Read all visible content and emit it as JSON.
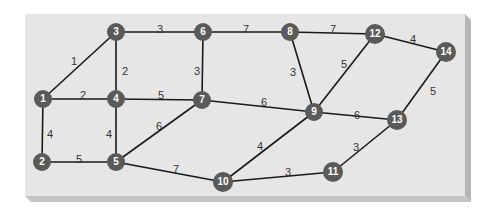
{
  "colors": {
    "panel_face": "#e6e6e6",
    "panel_edge_right": "#b5b5b5",
    "panel_edge_bottom": "#c4c4c4",
    "node_fill": "#5a5a5a",
    "node_text": "#ffffff",
    "edge_color": "#1a1a1a",
    "label_color": "#333333"
  },
  "nodes": [
    {
      "id": "1",
      "x": 43,
      "y": 99
    },
    {
      "id": "2",
      "x": 42,
      "y": 162
    },
    {
      "id": "3",
      "x": 116,
      "y": 32
    },
    {
      "id": "4",
      "x": 116,
      "y": 99
    },
    {
      "id": "5",
      "x": 116,
      "y": 162
    },
    {
      "id": "6",
      "x": 203,
      "y": 32
    },
    {
      "id": "7",
      "x": 202,
      "y": 100
    },
    {
      "id": "8",
      "x": 290,
      "y": 32
    },
    {
      "id": "9",
      "x": 314,
      "y": 112
    },
    {
      "id": "10",
      "x": 223,
      "y": 182
    },
    {
      "id": "11",
      "x": 333,
      "y": 172
    },
    {
      "id": "12",
      "x": 375,
      "y": 34
    },
    {
      "id": "13",
      "x": 397,
      "y": 120
    },
    {
      "id": "14",
      "x": 446,
      "y": 52
    }
  ],
  "edges": [
    {
      "from": "1",
      "to": "3",
      "weight": "1",
      "lx": 74,
      "ly": 62
    },
    {
      "from": "1",
      "to": "4",
      "weight": "2",
      "lx": 83,
      "ly": 96
    },
    {
      "from": "1",
      "to": "2",
      "weight": "4",
      "lx": 50,
      "ly": 135
    },
    {
      "from": "3",
      "to": "4",
      "weight": "2",
      "lx": 125,
      "ly": 72
    },
    {
      "from": "3",
      "to": "6",
      "weight": "3",
      "lx": 160,
      "ly": 30
    },
    {
      "from": "4",
      "to": "7",
      "weight": "5",
      "lx": 161,
      "ly": 96
    },
    {
      "from": "4",
      "to": "5",
      "weight": "4",
      "lx": 109,
      "ly": 135
    },
    {
      "from": "2",
      "to": "5",
      "weight": "5",
      "lx": 79,
      "ly": 160
    },
    {
      "from": "5",
      "to": "7",
      "weight": "6",
      "lx": 159,
      "ly": 127
    },
    {
      "from": "5",
      "to": "10",
      "weight": "7",
      "lx": 176,
      "ly": 170
    },
    {
      "from": "6",
      "to": "7",
      "weight": "3",
      "lx": 197,
      "ly": 72
    },
    {
      "from": "6",
      "to": "8",
      "weight": "7",
      "lx": 246,
      "ly": 30
    },
    {
      "from": "7",
      "to": "9",
      "weight": "6",
      "lx": 264,
      "ly": 103
    },
    {
      "from": "8",
      "to": "12",
      "weight": "7",
      "lx": 333,
      "ly": 30
    },
    {
      "from": "8",
      "to": "9",
      "weight": "3",
      "lx": 293,
      "ly": 73
    },
    {
      "from": "9",
      "to": "12",
      "weight": "5",
      "lx": 344,
      "ly": 65
    },
    {
      "from": "9",
      "to": "13",
      "weight": "6",
      "lx": 357,
      "ly": 116
    },
    {
      "from": "9",
      "to": "10",
      "weight": "4",
      "lx": 260,
      "ly": 147
    },
    {
      "from": "10",
      "to": "11",
      "weight": "3",
      "lx": 288,
      "ly": 173
    },
    {
      "from": "11",
      "to": "13",
      "weight": "3",
      "lx": 356,
      "ly": 148
    },
    {
      "from": "12",
      "to": "14",
      "weight": "4",
      "lx": 413,
      "ly": 40
    },
    {
      "from": "14",
      "to": "13",
      "weight": "5",
      "lx": 433,
      "ly": 92
    }
  ]
}
